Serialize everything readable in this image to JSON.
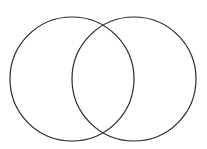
{
  "diagram": {
    "type": "venn",
    "background": "#ffffff",
    "stroke_color": "#2a2a2a",
    "stroke_width": 1.2,
    "circles": [
      {
        "name": "left-set",
        "cx": 72,
        "cy": 79,
        "r": 62,
        "label": ""
      },
      {
        "name": "right-set",
        "cx": 134,
        "cy": 79,
        "r": 62,
        "label": ""
      }
    ]
  }
}
